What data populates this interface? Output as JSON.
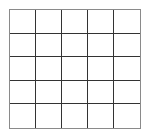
{
  "grid": {
    "rows": 5,
    "columns": 5,
    "border_color": "#8a8a8a",
    "line_color": "#333333",
    "background": "#ffffff",
    "cells": [
      [
        "",
        "",
        "",
        "",
        ""
      ],
      [
        "",
        "",
        "",
        "",
        ""
      ],
      [
        "",
        "",
        "",
        "",
        ""
      ],
      [
        "",
        "",
        "",
        "",
        ""
      ],
      [
        "",
        "",
        "",
        "",
        ""
      ]
    ]
  }
}
